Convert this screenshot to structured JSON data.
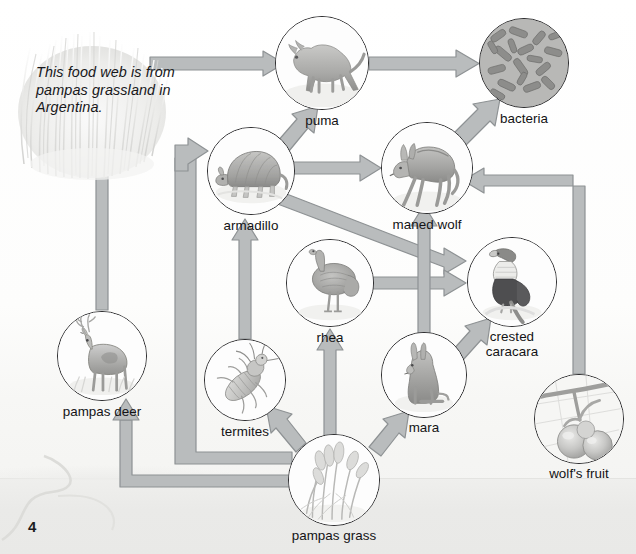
{
  "page": {
    "page_number": "4",
    "caption": "This food web\nis from pampas\ngrassland in\nArgentina.",
    "colors": {
      "arrow_fill": "#b9bcbd",
      "arrow_stroke": "#8e9294",
      "circle_stroke": "#2a2a2c",
      "text": "#131315",
      "background": "#fcfcfb",
      "ground": "#eaeae8"
    }
  },
  "diagram": {
    "type": "food-web",
    "nodes": [
      {
        "id": "puma",
        "label": "puma",
        "cx": 322,
        "cy": 63,
        "r": 47
      },
      {
        "id": "bacteria",
        "label": "bacteria",
        "cx": 524,
        "cy": 63,
        "r": 45
      },
      {
        "id": "armadillo",
        "label": "armadillo",
        "cx": 251,
        "cy": 171,
        "r": 44
      },
      {
        "id": "maned-wolf",
        "label": "maned wolf",
        "cx": 427,
        "cy": 168,
        "r": 46
      },
      {
        "id": "rhea",
        "label": "rhea",
        "cx": 330,
        "cy": 283,
        "r": 44
      },
      {
        "id": "crested-caracara",
        "label": "crested\ncaracara",
        "cx": 512,
        "cy": 282,
        "r": 45
      },
      {
        "id": "termites",
        "label": "termites",
        "cx": 245,
        "cy": 380,
        "r": 41
      },
      {
        "id": "mara",
        "label": "mara",
        "cx": 424,
        "cy": 375,
        "r": 43
      },
      {
        "id": "wolfs-fruit",
        "label": "wolf's fruit",
        "cx": 579,
        "cy": 419,
        "r": 45
      },
      {
        "id": "pampas-deer",
        "label": "pampas deer",
        "cx": 102,
        "cy": 356,
        "r": 45
      },
      {
        "id": "pampas-grass",
        "label": "pampas grass",
        "cx": 334,
        "cy": 480,
        "r": 46
      }
    ],
    "links": [
      {
        "from": "pampas-grass",
        "to": "puma",
        "note": "long route behind grass tuft"
      },
      {
        "from": "pampas-grass",
        "to": "pampas-deer"
      },
      {
        "from": "pampas-grass",
        "to": "armadillo"
      },
      {
        "from": "pampas-grass",
        "to": "termites"
      },
      {
        "from": "pampas-grass",
        "to": "rhea"
      },
      {
        "from": "pampas-grass",
        "to": "mara"
      },
      {
        "from": "pampas-deer",
        "to": "puma"
      },
      {
        "from": "termites",
        "to": "armadillo"
      },
      {
        "from": "armadillo",
        "to": "puma"
      },
      {
        "from": "armadillo",
        "to": "maned wolf"
      },
      {
        "from": "armadillo",
        "to": "crested-caracara"
      },
      {
        "from": "rhea",
        "to": "crested-caracara"
      },
      {
        "from": "mara",
        "to": "maned-wolf"
      },
      {
        "from": "mara",
        "to": "crested-caracara"
      },
      {
        "from": "wolfs-fruit",
        "to": "maned-wolf"
      },
      {
        "from": "puma",
        "to": "bacteria"
      },
      {
        "from": "maned-wolf",
        "to": "bacteria"
      }
    ]
  }
}
